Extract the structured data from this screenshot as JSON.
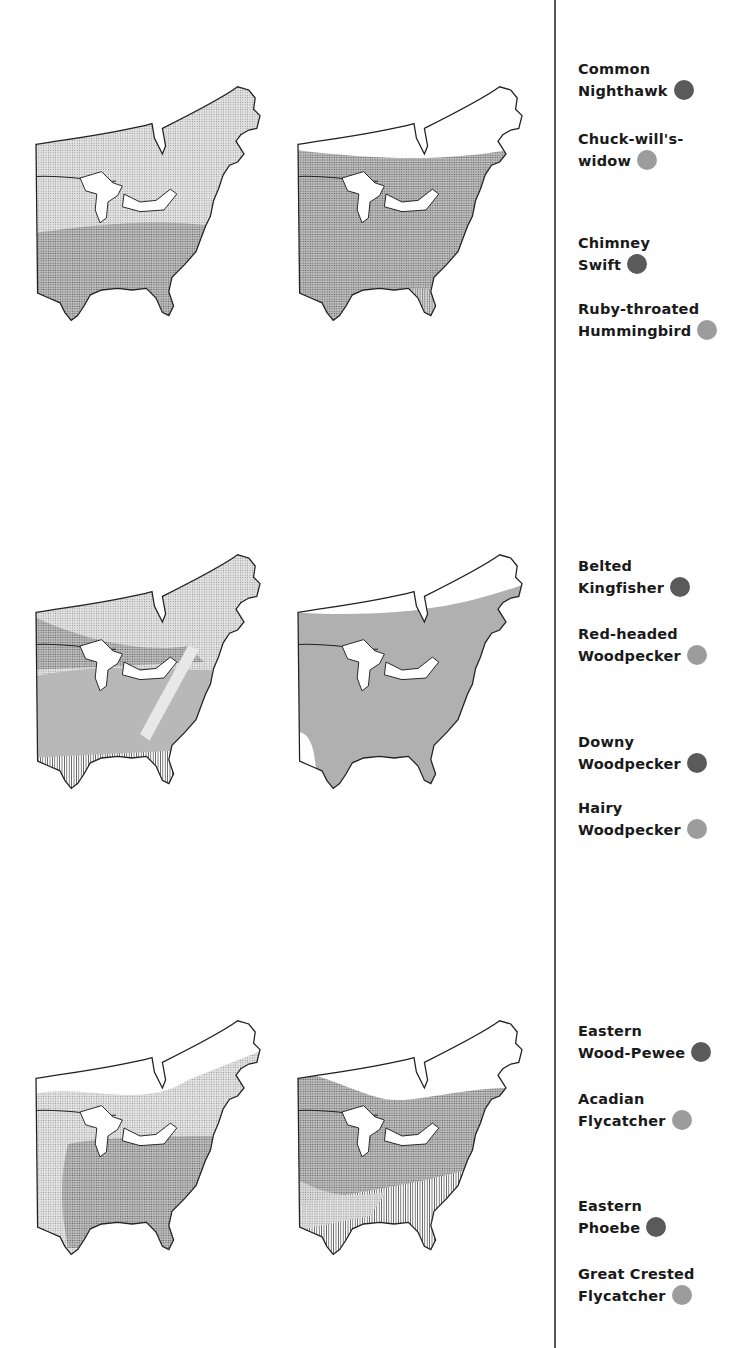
{
  "colors": {
    "dark_species": "#5a5a5a",
    "light_species": "#9c9c9c",
    "range_fill_dark": "#a8a8a8",
    "range_fill_light": "#d6d6d6",
    "outline": "#222222",
    "divider": "#555555"
  },
  "rows": [
    {
      "maps": [
        {
          "id": "map-1a",
          "species_pair": [
            "Common Nighthawk",
            "Chuck-will's-widow"
          ]
        },
        {
          "id": "map-1b",
          "species_pair": [
            "Chimney Swift",
            "Ruby-throated Hummingbird"
          ]
        }
      ],
      "legend": [
        {
          "line1": "Common",
          "line2": "Nighthawk",
          "dot": "dark"
        },
        {
          "line1": "Chuck-will's-",
          "line2": "widow",
          "dot": "light"
        },
        {
          "line1": "Chimney",
          "line2": "Swift",
          "dot": "dark"
        },
        {
          "line1": "Ruby-throated",
          "line2": "Hummingbird",
          "dot": "light"
        }
      ]
    },
    {
      "maps": [
        {
          "id": "map-2a",
          "species_pair": [
            "Belted Kingfisher",
            "Red-headed Woodpecker"
          ]
        },
        {
          "id": "map-2b",
          "species_pair": [
            "Downy Woodpecker",
            "Hairy Woodpecker"
          ]
        }
      ],
      "legend": [
        {
          "line1": "Belted",
          "line2": "Kingfisher",
          "dot": "dark"
        },
        {
          "line1": "Red-headed",
          "line2": "Woodpecker",
          "dot": "light"
        },
        {
          "line1": "Downy",
          "line2": "Woodpecker",
          "dot": "dark"
        },
        {
          "line1": "Hairy",
          "line2": "Woodpecker",
          "dot": "light"
        }
      ]
    },
    {
      "maps": [
        {
          "id": "map-3a",
          "species_pair": [
            "Eastern Wood-Pewee",
            "Acadian Flycatcher"
          ]
        },
        {
          "id": "map-3b",
          "species_pair": [
            "Eastern Phoebe",
            "Great Crested Flycatcher"
          ]
        }
      ],
      "legend": [
        {
          "line1": "Eastern",
          "line2": "Wood-Pewee",
          "dot": "dark"
        },
        {
          "line1": "Acadian",
          "line2": "Flycatcher",
          "dot": "light"
        },
        {
          "line1": "Eastern",
          "line2": "Phoebe",
          "dot": "dark"
        },
        {
          "line1": "Great Crested",
          "line2": "Flycatcher",
          "dot": "light"
        }
      ]
    }
  ]
}
